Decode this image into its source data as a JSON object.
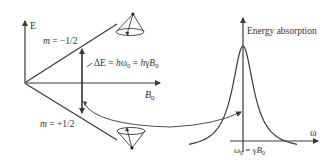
{
  "diagram": {
    "energy_level_plot": {
      "y_axis_label": "E",
      "x_axis_label": {
        "base": "B",
        "sub": "0"
      },
      "upper_level_label": {
        "m": "m",
        "rest": " = −1/2"
      },
      "lower_level_label": {
        "m": "m",
        "rest": " = +1/2"
      },
      "delta_e_label": {
        "part1": "ΔE = ",
        "h1": "h",
        "omega": "ω",
        "sub0a": "0",
        "eq": " = ",
        "h2": "h",
        "gamma": "γ",
        "B": "B",
        "sub0b": "0"
      },
      "upper_cone": "precession-cone-down-spin",
      "lower_cone": "precession-cone-up-spin"
    },
    "absorption_plot": {
      "y_axis_label": "Energy absorption",
      "x_axis_label": "ω",
      "peak_label": {
        "omega": "ω",
        "sub0a": "0",
        "eq": " = γ",
        "B": "B",
        "sub0b": "0"
      },
      "curve_type": "lorentzian"
    },
    "stroke_color": "#3a3a3a",
    "text_color": "#333333"
  }
}
